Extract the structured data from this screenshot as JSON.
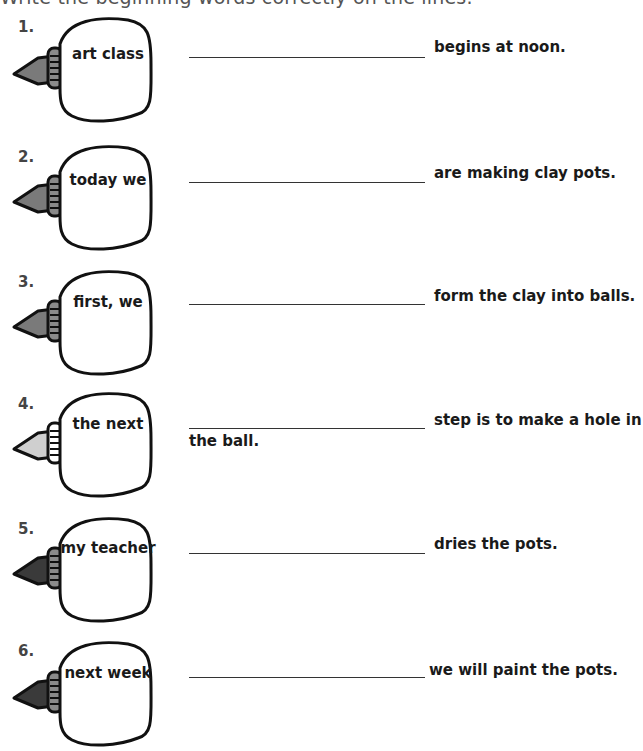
{
  "instructions": "Write the beginning words correctly on the lines.",
  "colors": {
    "nozzle_gray": "#7a7a7a",
    "nozzle_light": "#cfcfcf",
    "nozzle_dark": "#3a3a3a",
    "cap_gray": "#8a8a8a",
    "cap_white": "#ffffff",
    "outline": "#111111"
  },
  "items": [
    {
      "number": "1.",
      "bottle_text": "art class",
      "answer": "",
      "suffix": "begins at noon.",
      "continuation": "",
      "nozzle": "gray"
    },
    {
      "number": "2.",
      "bottle_text": "today we",
      "answer": "",
      "suffix": "are making clay pots.",
      "continuation": "",
      "nozzle": "gray"
    },
    {
      "number": "3.",
      "bottle_text": "first, we",
      "answer": "",
      "suffix": "form the clay into balls.",
      "continuation": "",
      "nozzle": "gray"
    },
    {
      "number": "4.",
      "bottle_text": "the next",
      "answer": "",
      "suffix": "step is to make a hole in",
      "continuation": "the ball.",
      "nozzle": "light"
    },
    {
      "number": "5.",
      "bottle_text": "my teacher",
      "answer": "",
      "suffix": "dries the pots.",
      "continuation": "",
      "nozzle": "dark"
    },
    {
      "number": "6.",
      "bottle_text": "next week",
      "answer": "",
      "suffix": "we will paint the pots.",
      "continuation": "",
      "nozzle": "dark"
    }
  ]
}
